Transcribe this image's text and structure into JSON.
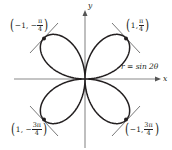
{
  "figure": {
    "equation": "r = sin 2θ",
    "axes": {
      "x_label": "x",
      "y_label": "y"
    },
    "points": [
      {
        "id": "upper-left",
        "prefix": "−1, −",
        "num": "π",
        "den": "4",
        "r": -1,
        "theta": "-π/4"
      },
      {
        "id": "upper-right",
        "prefix": "1, ",
        "num": "π",
        "den": "4",
        "r": 1,
        "theta": "π/4"
      },
      {
        "id": "lower-left",
        "prefix": "1, −",
        "num": "3π",
        "den": "4",
        "r": 1,
        "theta": "-3π/4"
      },
      {
        "id": "lower-right",
        "prefix": "−1, ",
        "num": "3π",
        "den": "4",
        "r": -1,
        "theta": "3π/4"
      }
    ],
    "colors": {
      "curve": "#231f20",
      "axis": "#8a8a8a",
      "tangent": "#555555"
    }
  }
}
